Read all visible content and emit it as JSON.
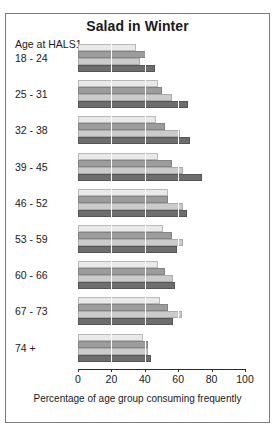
{
  "chart_data": {
    "type": "bar",
    "title": "Salad in Winter",
    "xlabel": "Percentage of age group consuming frequently",
    "ylabel": "Age at HALS1",
    "xlim": [
      0,
      100
    ],
    "ylim": null,
    "grid": true,
    "orientation": "horizontal",
    "legend": null,
    "legend_position": "none",
    "xticks": [
      0,
      20,
      40,
      60,
      80,
      100
    ],
    "categories": [
      "18 - 24",
      "25 - 31",
      "32 - 38",
      "39 - 45",
      "46 - 52",
      "53 - 59",
      "60 - 66",
      "67 - 73",
      "74 +"
    ],
    "series": [
      {
        "name": "series-1",
        "values": [
          35,
          48,
          47,
          48,
          54,
          51,
          48,
          49,
          39
        ]
      },
      {
        "name": "series-2",
        "values": [
          41,
          50,
          52,
          56,
          54,
          56,
          52,
          54,
          42
        ]
      },
      {
        "name": "series-3",
        "values": [
          37,
          56,
          61,
          63,
          63,
          63,
          57,
          62,
          42
        ]
      },
      {
        "name": "series-4",
        "values": [
          46,
          66,
          67,
          74,
          65,
          59,
          58,
          57,
          44
        ]
      }
    ]
  },
  "colors": {
    "series_1": "#e9e9e9",
    "series_2": "#9c9c9c",
    "series_3": "#cbcbcb",
    "series_4": "#6d6d6d",
    "frame": "#7a7a7a",
    "axis": "#2b2b2b",
    "gridline": "#ffffff"
  }
}
